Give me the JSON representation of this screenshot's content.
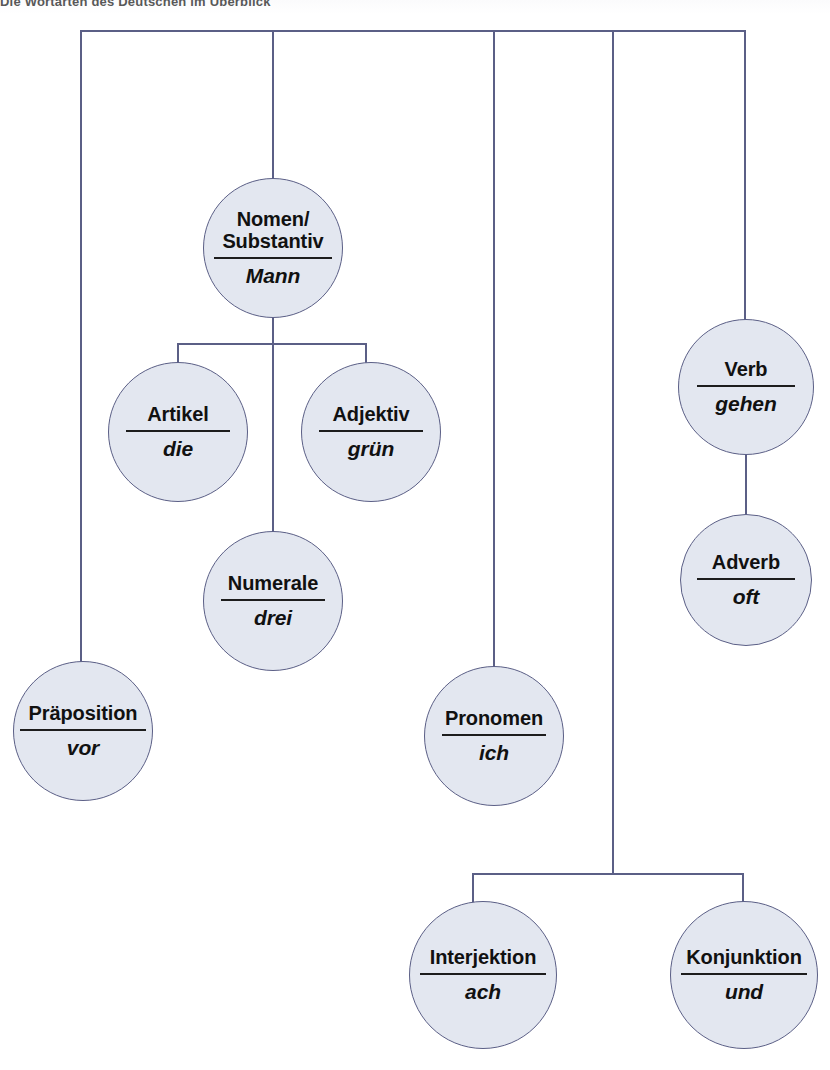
{
  "page": {
    "caption_sliver": "Die Wortarten des Deutschen im Überblick",
    "background_color": "#ffffff"
  },
  "style": {
    "node_fill": "#e3e7f0",
    "node_border": "#5b5f86",
    "connector_color": "#5b5f86",
    "rule_color": "#1d1d1d",
    "text_color": "#111111"
  },
  "diagram": {
    "type": "tree",
    "title": "Wortarten",
    "nodes": [
      {
        "id": "nomen",
        "pos": "Nomen/\nSubstantiv",
        "pos_lines": [
          "Nomen/",
          "Substantiv"
        ],
        "example": "Mann",
        "cx": 273,
        "cy": 248,
        "r": 70,
        "size": "n-nomen"
      },
      {
        "id": "artikel",
        "pos": "Artikel",
        "pos_lines": [
          "Artikel"
        ],
        "example": "die",
        "cx": 178,
        "cy": 432,
        "r": 70,
        "size": "n-med"
      },
      {
        "id": "adjektiv",
        "pos": "Adjektiv",
        "pos_lines": [
          "Adjektiv"
        ],
        "example": "grün",
        "cx": 371,
        "cy": 432,
        "r": 70,
        "size": "n-med"
      },
      {
        "id": "numerale",
        "pos": "Numerale",
        "pos_lines": [
          "Numerale"
        ],
        "example": "drei",
        "cx": 273,
        "cy": 601,
        "r": 70,
        "size": "n-med"
      },
      {
        "id": "praeposition",
        "pos": "Präposition",
        "pos_lines": [
          "Präposition"
        ],
        "example": "vor",
        "cx": 83,
        "cy": 731,
        "r": 70,
        "size": "n-wide"
      },
      {
        "id": "pronomen",
        "pos": "Pronomen",
        "pos_lines": [
          "Pronomen"
        ],
        "example": "ich",
        "cx": 494,
        "cy": 736,
        "r": 70,
        "size": "n-med"
      },
      {
        "id": "verb",
        "pos": "Verb",
        "pos_lines": [
          "Verb"
        ],
        "example": "gehen",
        "cx": 746,
        "cy": 387,
        "r": 68,
        "size": "n-narrow"
      },
      {
        "id": "adverb",
        "pos": "Adverb",
        "pos_lines": [
          "Adverb"
        ],
        "example": "oft",
        "cx": 746,
        "cy": 580,
        "r": 66,
        "size": "n-narrow"
      },
      {
        "id": "interjektion",
        "pos": "Interjektion",
        "pos_lines": [
          "Interjektion"
        ],
        "example": "ach",
        "cx": 483,
        "cy": 975,
        "r": 74,
        "size": "n-wide"
      },
      {
        "id": "konjunktion",
        "pos": "Konjunktion",
        "pos_lines": [
          "Konjunktion"
        ],
        "example": "und",
        "cx": 744,
        "cy": 975,
        "r": 74,
        "size": "n-wide"
      }
    ],
    "edges": [
      {
        "from": "root",
        "to": "praeposition"
      },
      {
        "from": "root",
        "to": "nomen"
      },
      {
        "from": "root",
        "to": "pronomen"
      },
      {
        "from": "root",
        "to": "interjektion-konjunktion-group"
      },
      {
        "from": "root",
        "to": "verb"
      },
      {
        "from": "nomen",
        "to": "artikel"
      },
      {
        "from": "nomen",
        "to": "adjektiv"
      },
      {
        "from": "nomen",
        "to": "numerale"
      },
      {
        "from": "verb",
        "to": "adverb"
      },
      {
        "from": "group",
        "to": "interjektion"
      },
      {
        "from": "group",
        "to": "konjunktion"
      }
    ]
  }
}
